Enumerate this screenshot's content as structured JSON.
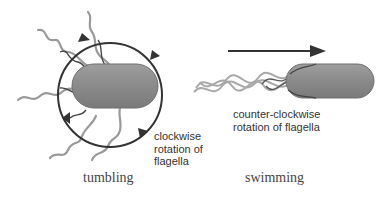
{
  "diagram": {
    "left_panel": {
      "name": "tumbling",
      "caption": "tumbling",
      "annotation": [
        "clockwise",
        "rotation of",
        "flagella"
      ]
    },
    "right_panel": {
      "name": "swimming",
      "caption": "swimming",
      "annotation": [
        "counter-clockwise",
        "rotation of flagella"
      ]
    },
    "colors": {
      "cell_body": "#8c8c8c",
      "flagella": "#9a9a9a",
      "circle": "#333333",
      "arrow": "#333333"
    }
  }
}
